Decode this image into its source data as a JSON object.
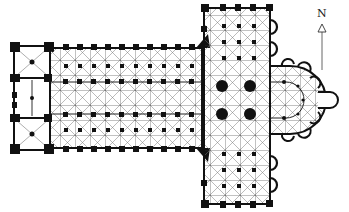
{
  "figure": {
    "type": "architectural floor plan",
    "colors": {
      "wall": "#111111",
      "rib": "#555555",
      "background": "#ffffff"
    }
  },
  "compass": {
    "label": "N",
    "direction": "up"
  },
  "plan": {
    "parts": [
      {
        "name": "west-front",
        "description": "twin-tower western block"
      },
      {
        "name": "nave",
        "description": "nave with double aisles, rib-vaulted bays"
      },
      {
        "name": "transept",
        "description": "projecting transept with aisles"
      },
      {
        "name": "crossing",
        "description": "four large crossing piers"
      },
      {
        "name": "choir",
        "description": "choir with ambulatory"
      },
      {
        "name": "chevet",
        "description": "apse with radiating chapels and axial chapel"
      }
    ],
    "nave_bays": 9,
    "crossing_piers": 4
  }
}
